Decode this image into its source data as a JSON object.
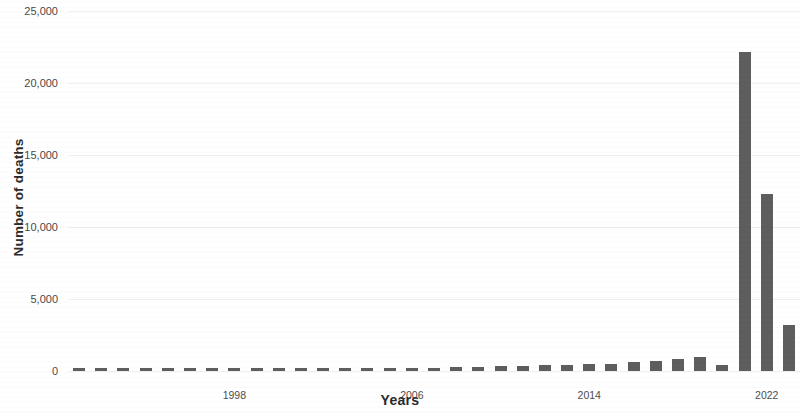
{
  "chart_data": {
    "type": "bar",
    "title": "",
    "xlabel": "Years",
    "ylabel": "Number of deaths",
    "ylim": [
      0,
      25000
    ],
    "y_ticks": [
      0,
      5000,
      10000,
      15000,
      20000,
      25000
    ],
    "y_tick_labels": [
      "0",
      "5,000",
      "10,000",
      "15,000",
      "20,000",
      "25,000"
    ],
    "x_tick_labels": [
      "1998",
      "2006",
      "2014",
      "2022"
    ],
    "x_tick_values": [
      1998,
      2006,
      2014,
      2022
    ],
    "grid": true,
    "legend": "none",
    "bar_color": "#5e5e5e",
    "categories": [
      "1991",
      "1992",
      "1993",
      "1994",
      "1995",
      "1996",
      "1997",
      "1998",
      "1999",
      "2000",
      "2001",
      "2002",
      "2003",
      "2004",
      "2005",
      "2006",
      "2007",
      "2008",
      "2009",
      "2010",
      "2011",
      "2012",
      "2013",
      "2014",
      "2015",
      "2016",
      "2017",
      "2018",
      "2019",
      "2020",
      "2021",
      "2022",
      "2023"
    ],
    "values": [
      120,
      150,
      140,
      160,
      110,
      120,
      130,
      140,
      150,
      170,
      180,
      160,
      150,
      200,
      190,
      210,
      230,
      260,
      300,
      330,
      360,
      400,
      430,
      470,
      520,
      600,
      700,
      820,
      980,
      400,
      22150,
      12300,
      3200
    ]
  },
  "axis": {
    "y_title": "Number of deaths",
    "x_title": "Years"
  }
}
